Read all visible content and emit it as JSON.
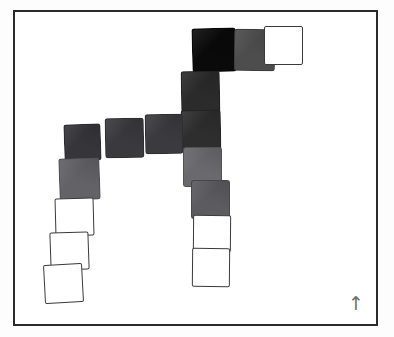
{
  "scene": {
    "title": "Tile Figure",
    "background_color": "#fdfdfd",
    "frame": {
      "color": "#2b2b2b",
      "x": 13,
      "y": 10,
      "width": 365,
      "height": 316
    },
    "orientation_marker": {
      "glyph": "↑",
      "label": "up-arrow",
      "color": "#6f6f6f",
      "x": 348,
      "y": 292
    }
  },
  "legend": {
    "black": "#0a0a0a",
    "very_dark_gray": "#262626",
    "dark_gray": "#333333",
    "medium_dark_gray": "#404040",
    "medium_gray": "#4a4a4a",
    "gray": "#636363",
    "light_gray": "#6a6a6a",
    "white_outline": "#ffffff"
  },
  "tiles": [
    {
      "id": "t01",
      "name": "tile-top-black",
      "x": 192,
      "y": 28,
      "w": 44,
      "h": 44,
      "rot": -1.5,
      "fill": "#0a0a0a",
      "style": "filled",
      "shade": "black"
    },
    {
      "id": "t02",
      "name": "tile-top-gray",
      "x": 234,
      "y": 29,
      "w": 41,
      "h": 42,
      "rot": 0.5,
      "fill": "#4d4d4d",
      "style": "filled",
      "shade": "medium_gray"
    },
    {
      "id": "t03",
      "name": "tile-top-white",
      "x": 264,
      "y": 26,
      "w": 39,
      "h": 39,
      "rot": 0,
      "fill": "#ffffff",
      "style": "empty",
      "shade": "white_outline"
    },
    {
      "id": "t04",
      "name": "tile-stem-upper",
      "x": 181,
      "y": 71,
      "w": 39,
      "h": 42,
      "rot": -1,
      "fill": "#2b2b2b",
      "style": "filled",
      "shade": "very_dark_gray"
    },
    {
      "id": "t05",
      "name": "tile-stem-center",
      "x": 181,
      "y": 110,
      "w": 40,
      "h": 40,
      "rot": -1,
      "fill": "#2e2e2e",
      "style": "filled",
      "shade": "very_dark_gray"
    },
    {
      "id": "t06",
      "name": "tile-arm-left-outer",
      "x": 64,
      "y": 124,
      "w": 37,
      "h": 37,
      "rot": -2,
      "fill": "#36363a",
      "style": "filled",
      "shade": "dark_gray"
    },
    {
      "id": "t07",
      "name": "tile-arm-left-mid",
      "x": 105,
      "y": 118,
      "w": 39,
      "h": 40,
      "rot": -1,
      "fill": "#3a3a3e",
      "style": "filled",
      "shade": "dark_gray"
    },
    {
      "id": "t08",
      "name": "tile-arm-left-inner",
      "x": 145,
      "y": 114,
      "w": 38,
      "h": 40,
      "rot": -1,
      "fill": "#3b3b3f",
      "style": "filled",
      "shade": "medium_dark_gray"
    },
    {
      "id": "t09",
      "name": "tile-left-down-gray",
      "x": 59,
      "y": 158,
      "w": 41,
      "h": 42,
      "rot": -2,
      "fill": "#636367",
      "style": "filled",
      "shade": "gray"
    },
    {
      "id": "t10",
      "name": "tile-left-white-upper",
      "x": 55,
      "y": 198,
      "w": 39,
      "h": 38,
      "rot": -1.5,
      "fill": "#ffffff",
      "style": "empty",
      "shade": "white_outline"
    },
    {
      "id": "t11",
      "name": "tile-left-white-mid",
      "x": 50,
      "y": 232,
      "w": 39,
      "h": 38,
      "rot": -2,
      "fill": "#ffffff",
      "style": "empty",
      "shade": "white_outline"
    },
    {
      "id": "t12",
      "name": "tile-left-white-lower",
      "x": 44,
      "y": 264,
      "w": 39,
      "h": 39,
      "rot": -3,
      "fill": "#ffffff",
      "style": "empty",
      "shade": "white_outline"
    },
    {
      "id": "t13",
      "name": "tile-stem-lower-gray",
      "x": 183,
      "y": 147,
      "w": 39,
      "h": 40,
      "rot": 0,
      "fill": "#6a6a6e",
      "style": "filled",
      "shade": "light_gray"
    },
    {
      "id": "t14",
      "name": "tile-stem-foot-gray",
      "x": 191,
      "y": 180,
      "w": 39,
      "h": 39,
      "rot": 0,
      "fill": "#5c5c60",
      "style": "filled",
      "shade": "gray"
    },
    {
      "id": "t15",
      "name": "tile-right-white-up",
      "x": 193,
      "y": 215,
      "w": 38,
      "h": 37,
      "rot": 0.5,
      "fill": "#ffffff",
      "style": "empty",
      "shade": "white_outline"
    },
    {
      "id": "t16",
      "name": "tile-right-white-down",
      "x": 192,
      "y": 248,
      "w": 38,
      "h": 39,
      "rot": 0.5,
      "fill": "#ffffff",
      "style": "empty",
      "shade": "white_outline"
    }
  ]
}
